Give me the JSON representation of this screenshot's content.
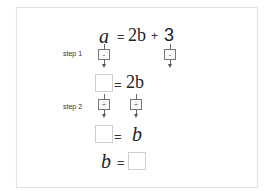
{
  "equation": {
    "lhs": "a",
    "equals": "=",
    "term1": "2b",
    "plus": "+",
    "term2": "3"
  },
  "step1": {
    "label": "step 1",
    "left_op": "-",
    "right_op": "-"
  },
  "line2": {
    "equals": "=",
    "rhs": "2b"
  },
  "step2": {
    "label": "step 2",
    "left_op": "÷",
    "right_op": "÷"
  },
  "line3": {
    "equals": "=",
    "rhs": "b"
  },
  "line4": {
    "lhs": "b",
    "equals": "="
  }
}
